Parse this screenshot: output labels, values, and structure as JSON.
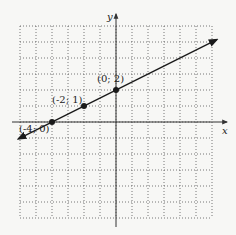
{
  "chart_data": {
    "type": "line",
    "title": "",
    "xlabel": "x",
    "ylabel": "y",
    "xlim": [
      -6,
      6
    ],
    "ylim": [
      -6,
      6
    ],
    "grid": true,
    "grid_style": "dotted",
    "tick_labels_shown": false,
    "series": [
      {
        "name": "line y = x/2 + 2",
        "x": [
          -6.1,
          6.3
        ],
        "y": [
          -1.05,
          5.15
        ],
        "arrow_ends": true
      }
    ],
    "points": [
      {
        "x": 0,
        "y": 2,
        "label": "(0; 2)"
      },
      {
        "x": -2,
        "y": 1,
        "label": "(-2; 1)"
      },
      {
        "x": -4,
        "y": 0,
        "label": "(-4; 0)"
      }
    ],
    "colors": {
      "line": "#1a1a1a",
      "grid": "#555555",
      "axes": "#333333",
      "background": "#f7f7f5"
    }
  }
}
